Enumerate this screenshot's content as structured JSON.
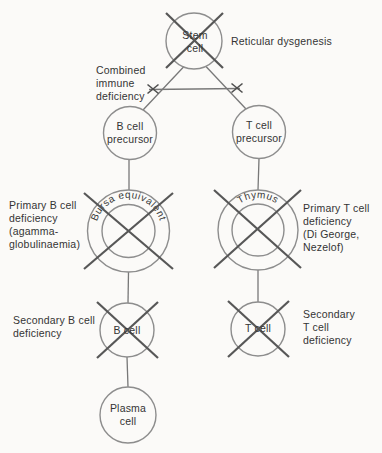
{
  "colors": {
    "background": "#fbfaf8",
    "circle_stroke": "#8d8d8d",
    "connector_stroke": "#787878",
    "cross_stroke": "#575757",
    "text": "#343434"
  },
  "nodes": {
    "stem": {
      "label": "Stem\ncell"
    },
    "b_precursor": {
      "label": "B cell\nprecursor"
    },
    "t_precursor": {
      "label": "T cell\nprecursor"
    },
    "bursa": {
      "label": "Bursa equivalent"
    },
    "thymus": {
      "label": "Thymus"
    },
    "b_cell": {
      "label": "B cell"
    },
    "t_cell": {
      "label": "T cell"
    },
    "plasma": {
      "label": "Plasma\ncell"
    }
  },
  "annotations": {
    "reticular": "Reticular dysgenesis",
    "combined": "Combined\nimmune\ndeficiency",
    "primary_b": "Primary B cell\ndeficiency\n(agamma-\nglobulinaemia)",
    "primary_t": "Primary T cell\ndeficiency\n(Di George,\nNezelof)",
    "secondary_b": "Secondary B cell\ndeficiency",
    "secondary_t": "Secondary\nT cell\ndeficiency"
  }
}
